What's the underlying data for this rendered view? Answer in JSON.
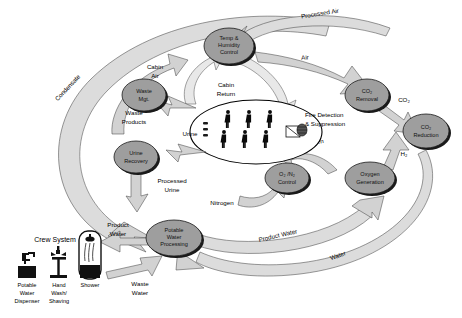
{
  "diagram": {
    "nodes": [
      {
        "id": "temp-humidity-control",
        "label_lines": [
          "Temp &",
          "Humidity",
          "Control"
        ]
      },
      {
        "id": "co2-removal",
        "label_lines": [
          "CO₂",
          "Removal"
        ]
      },
      {
        "id": "co2-reduction",
        "label_lines": [
          "CO₂",
          "Reduction"
        ]
      },
      {
        "id": "oxygen-generation",
        "label_lines": [
          "Oxygen",
          "Generation"
        ]
      },
      {
        "id": "o2-n2-control",
        "label_lines": [
          "O₂ /N₂",
          "Control"
        ]
      },
      {
        "id": "waste-mgt",
        "label_lines": [
          "Waste",
          "Mgt."
        ]
      },
      {
        "id": "urine-recovery",
        "label_lines": [
          "Urine",
          "Recovery"
        ]
      },
      {
        "id": "potable-water-processing",
        "label_lines": [
          "Potable",
          "Water",
          "Processing"
        ]
      }
    ],
    "flow_labels": {
      "condensate": "Condensate",
      "processed_air": "Processed Air",
      "air": "Air",
      "co2": "CO₂",
      "h2": "H₂",
      "oxygen": "Oxygen",
      "nitrogen": "Nitrogen",
      "cabin_air": [
        "Cabin",
        "Air"
      ],
      "cabin_return": [
        "Cabin",
        "Return"
      ],
      "urine": "Urine",
      "processed_urine": [
        "Processed",
        "Urine"
      ],
      "waste_products": [
        "Waste",
        "Products"
      ],
      "product_water_left": [
        "Product",
        "Water"
      ],
      "product_water_arc": "Product Water",
      "waste_water": [
        "Waste",
        "Water"
      ],
      "water": "Water",
      "fire_detection": [
        "Fire Detection",
        "& Suppression"
      ]
    },
    "crew_system": {
      "title": "Crew System",
      "items": [
        {
          "id": "potable-water-dispenser",
          "caption": [
            "Potable",
            "Water",
            "Dispenser"
          ],
          "icon": "faucet-box-icon"
        },
        {
          "id": "hand-wash-shaving",
          "caption": [
            "Hand",
            "Wash/",
            "Shaving"
          ],
          "icon": "sink-faucet-icon"
        },
        {
          "id": "shower",
          "caption": [
            "Shower"
          ],
          "icon": "shower-stall-icon"
        }
      ]
    },
    "crew_ellipse": {
      "id": "crew-compartment",
      "person_count": 6
    },
    "colors": {
      "node_fill": "#9e9e9e",
      "band_fill": "#dcdcdc",
      "arrow_fill": "#d2d2d2",
      "outline": "#1b1b1b",
      "background": "#ffffff"
    }
  }
}
